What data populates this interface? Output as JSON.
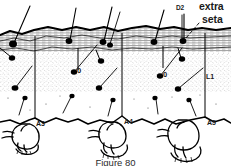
{
  "figure": {
    "caption": "Figure 80",
    "background_color": "#ffffff",
    "ink_color": "#000000"
  },
  "labels": {
    "d2": "D2",
    "extra_seta_line1": "extra",
    "extra_seta_line2": "seta",
    "l1": "L1",
    "zero_left": "0",
    "zero_right": "0",
    "a3": "A3",
    "a4": "A4",
    "a5": "A5"
  },
  "annotations": [
    {
      "name": "d2-label",
      "text": "D2",
      "x": 176,
      "y": 6
    },
    {
      "name": "extra-seta-label",
      "text": "extra seta",
      "x": 199,
      "y": 2
    },
    {
      "name": "l1-label",
      "text": "L1",
      "x": 206,
      "y": 78
    },
    {
      "name": "zero-left-label",
      "text": "0",
      "x": 76,
      "y": 69
    },
    {
      "name": "zero-right-label",
      "text": "0",
      "x": 162,
      "y": 73
    },
    {
      "name": "a3-label",
      "text": "A3",
      "x": 36,
      "y": 122
    },
    {
      "name": "a4-label",
      "text": "A4",
      "x": 123,
      "y": 120
    },
    {
      "name": "a5-label",
      "text": "A5",
      "x": 206,
      "y": 121
    }
  ]
}
